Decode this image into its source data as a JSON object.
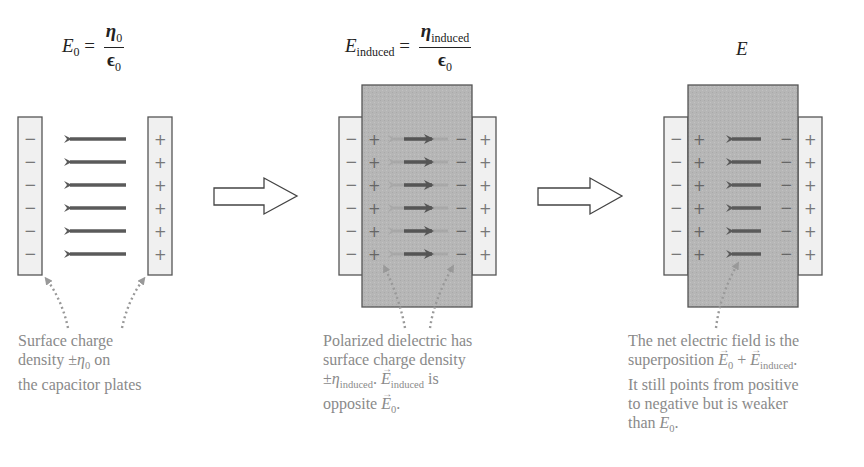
{
  "colors": {
    "plate_fill": "#f0f0f0",
    "plate_stroke": "#555555",
    "dielectric_fill": "#b4b4b4",
    "field_arrow": "#5a5a5a",
    "induced_arrow": "#9a9a9a",
    "caption_text": "#8a8a8a",
    "pointer_dots": "#999999"
  },
  "panels": [
    {
      "id": "vacuum",
      "formula": {
        "lhs": "E",
        "lhs_sub": "0",
        "eq": "=",
        "num": "η",
        "num_sub": "0",
        "den": "ϵ",
        "den_sub": "0"
      },
      "plate_left_signs": [
        "−",
        "−",
        "−",
        "−",
        "−",
        "−"
      ],
      "plate_right_signs": [
        "+",
        "+",
        "+",
        "+",
        "+",
        "+"
      ],
      "field_arrows": 6,
      "field_direction": "left",
      "caption_lines": [
        "Surface charge",
        "density ±η₀ on",
        "the capacitor plates"
      ],
      "caption": {
        "line1": "Surface charge",
        "line2_pre": "density ±",
        "line2_sym": "η",
        "line2_sub": "0",
        "line2_post": " on",
        "line3": "the capacitor plates"
      }
    },
    {
      "id": "induced",
      "formula": {
        "lhs": "E",
        "lhs_sub": "induced",
        "eq": "=",
        "num": "η",
        "num_sub": "induced",
        "den": "ϵ",
        "den_sub": "0"
      },
      "plate_left_signs": [
        "−",
        "−",
        "−",
        "−",
        "−",
        "−"
      ],
      "plate_right_signs": [
        "+",
        "+",
        "+",
        "+",
        "+",
        "+"
      ],
      "dielectric_left_signs": [
        "+",
        "+",
        "+",
        "+",
        "+",
        "+"
      ],
      "dielectric_right_signs": [
        "−",
        "−",
        "−",
        "−",
        "−",
        "−"
      ],
      "field_arrows": 6,
      "field_direction": "right (induced) over faint left (applied)",
      "caption": {
        "line1": "Polarized dielectric has",
        "line2": "surface charge density",
        "line3_pre": "±",
        "line3_sym": "η",
        "line3_sub": "induced",
        "line3_mid": ". ",
        "line3_vec": "E",
        "line3_vec_sub": "induced",
        "line3_post": " is",
        "line4_pre": "opposite ",
        "line4_vec": "E",
        "line4_vec_sub": "0",
        "line4_post": "."
      }
    },
    {
      "id": "net",
      "formula": {
        "lhs": "E"
      },
      "plate_left_signs": [
        "−",
        "−",
        "−",
        "−",
        "−",
        "−"
      ],
      "plate_right_signs": [
        "+",
        "+",
        "+",
        "+",
        "+",
        "+"
      ],
      "dielectric_left_signs": [
        "+",
        "+",
        "+",
        "+",
        "+",
        "+"
      ],
      "dielectric_right_signs": [
        "−",
        "−",
        "−",
        "−",
        "−",
        "−"
      ],
      "field_arrows": 6,
      "field_direction": "left (weaker)",
      "caption": {
        "line1": "The net electric field is the",
        "line2_pre": "superposition ",
        "line2_vec1": "E",
        "line2_vec1_sub": "0",
        "line2_plus": " + ",
        "line2_vec2": "E",
        "line2_vec2_sub": "induced",
        "line2_post": ".",
        "line3": "It still points from positive",
        "line4": "to negative but is weaker",
        "line5_pre": "than ",
        "line5_sym": "E",
        "line5_sub": "0",
        "line5_post": "."
      }
    }
  ],
  "transition_arrows": 2
}
